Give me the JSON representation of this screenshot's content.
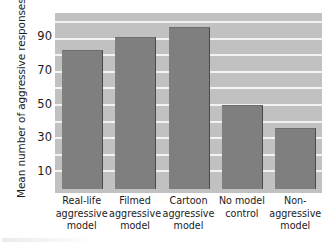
{
  "chart_data": {
    "type": "bar",
    "title": "",
    "xlabel": "",
    "ylabel": "Mean number of aggressive responses",
    "categories": [
      "Real-life aggressive model",
      "Filmed aggressive model",
      "Cartoon aggressive model",
      "No model control",
      "Non-aggressive model"
    ],
    "category_lines": [
      [
        "Real-life",
        "aggressive",
        "model"
      ],
      [
        "Filmed",
        "aggressive",
        "model"
      ],
      [
        "Cartoon",
        "aggressive",
        "model"
      ],
      [
        "No model",
        "control"
      ],
      [
        "Non-",
        "aggressive",
        "model"
      ]
    ],
    "values": [
      83,
      91,
      97,
      50,
      36
    ],
    "ylim": [
      0,
      106
    ],
    "yticks": [
      10,
      30,
      50,
      70,
      90
    ],
    "ytick_labels": [
      "10",
      "30",
      "50",
      "70",
      "90"
    ],
    "grid": true,
    "grid_orientation": "horizontal",
    "legend": "none",
    "colors": {
      "bar": "#7f7f80",
      "bar_edge": "#4a4a4b",
      "plot_background": "#c1c1c1",
      "gridline": "#f3f3f3",
      "text": "#1b1b1b",
      "figure_background": "#ffffff"
    }
  }
}
